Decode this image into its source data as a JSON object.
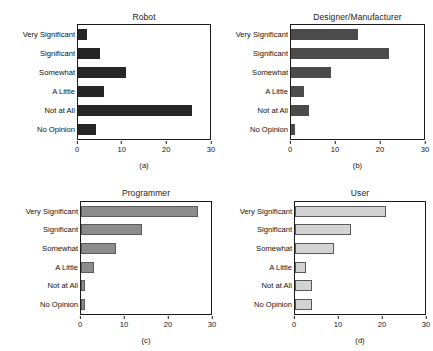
{
  "figure": {
    "categories": [
      "Very Significant",
      "Significant",
      "Somewhat",
      "A Little",
      "Not at All",
      "No Opinion"
    ],
    "xticks": [
      "0",
      "10",
      "20",
      "30"
    ],
    "captions": {
      "a": "(a)",
      "b": "(b)",
      "c": "(c)",
      "d": "(d)"
    }
  },
  "chart_data": [
    {
      "type": "bar",
      "orientation": "horizontal",
      "panel": "(a)",
      "title": "Robot",
      "categories": [
        "Very Significant",
        "Significant",
        "Somewhat",
        "A Little",
        "Not at All",
        "No Opinion"
      ],
      "values": [
        2,
        5,
        11,
        6,
        26,
        4
      ],
      "xlabel": "",
      "ylabel": "",
      "xlim": [
        0,
        30
      ],
      "xticks": [
        0,
        10,
        20,
        30
      ],
      "grid": false,
      "legend": "none",
      "bar_color": "#262626"
    },
    {
      "type": "bar",
      "orientation": "horizontal",
      "panel": "(b)",
      "title": "Designer/Manufacturer",
      "categories": [
        "Very Significant",
        "Significant",
        "Somewhat",
        "A Little",
        "Not at All",
        "No Opinion"
      ],
      "values": [
        15,
        22,
        9,
        3,
        4,
        1
      ],
      "xlabel": "",
      "ylabel": "",
      "xlim": [
        0,
        30
      ],
      "xticks": [
        0,
        10,
        20,
        30
      ],
      "grid": false,
      "legend": "none",
      "bar_color": "#4b4b4b"
    },
    {
      "type": "bar",
      "orientation": "horizontal",
      "panel": "(c)",
      "title": "Programmer",
      "categories": [
        "Very Significant",
        "Significant",
        "Somewhat",
        "A Little",
        "Not at All",
        "No Opinion"
      ],
      "values": [
        27,
        14,
        8,
        3,
        1,
        1
      ],
      "xlabel": "",
      "ylabel": "",
      "xlim": [
        0,
        30
      ],
      "xticks": [
        0,
        10,
        20,
        30
      ],
      "grid": false,
      "legend": "none",
      "bar_color": "#8c8c8c"
    },
    {
      "type": "bar",
      "orientation": "horizontal",
      "panel": "(d)",
      "title": "User",
      "categories": [
        "Very Significant",
        "Significant",
        "Somewhat",
        "A Little",
        "Not at All",
        "No Opinion"
      ],
      "values": [
        21,
        13,
        9,
        2.5,
        4,
        4
      ],
      "xlabel": "",
      "ylabel": "",
      "xlim": [
        0,
        30
      ],
      "xticks": [
        0,
        10,
        20,
        30
      ],
      "grid": false,
      "legend": "none",
      "bar_color": "#d3d3d3"
    }
  ]
}
